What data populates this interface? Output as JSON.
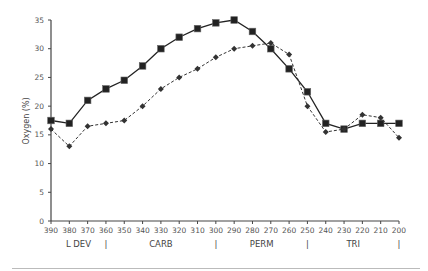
{
  "chart_data": {
    "type": "line",
    "title": "",
    "xlabel": "",
    "ylabel": "Oxygen (%)",
    "ylim": [
      0,
      35
    ],
    "y_ticks": [
      0,
      5,
      10,
      15,
      20,
      25,
      30,
      35
    ],
    "x_reversed": true,
    "grid": false,
    "legend": null,
    "x": [
      390,
      380,
      370,
      360,
      350,
      340,
      330,
      320,
      310,
      300,
      290,
      280,
      270,
      260,
      250,
      240,
      230,
      220,
      210,
      200
    ],
    "x_tick_labels": [
      "390",
      "380",
      "370",
      "360",
      "350",
      "340",
      "330",
      "320",
      "310",
      "300",
      "290",
      "280",
      "270",
      "260",
      "250",
      "240",
      "230",
      "220",
      "210",
      "200"
    ],
    "series": [
      {
        "name": "Series 1 (solid, square markers)",
        "style": "solid",
        "marker": "square",
        "color": "#222222",
        "values": [
          17.5,
          17,
          21,
          23,
          24.5,
          27,
          30,
          32,
          33.5,
          34.5,
          35,
          33,
          30,
          26.5,
          22.5,
          17,
          16,
          17,
          17,
          17
        ]
      },
      {
        "name": "Series 2 (dashed, diamond markers)",
        "style": "dashed",
        "marker": "diamond",
        "color": "#333333",
        "values": [
          16,
          13,
          16.5,
          17,
          17.5,
          20,
          23,
          25,
          26.5,
          28.5,
          30,
          30.5,
          31,
          29,
          20,
          15.5,
          16,
          18.5,
          18,
          14.5
        ]
      }
    ],
    "period_labels": [
      {
        "label": "L DEV",
        "x": 375
      },
      {
        "label": "CARB",
        "x": 330
      },
      {
        "label": "PERM",
        "x": 275
      },
      {
        "label": "TRI",
        "x": 225
      }
    ],
    "period_dividers": [
      360,
      300,
      250,
      200
    ],
    "divider_glyph": "|"
  }
}
